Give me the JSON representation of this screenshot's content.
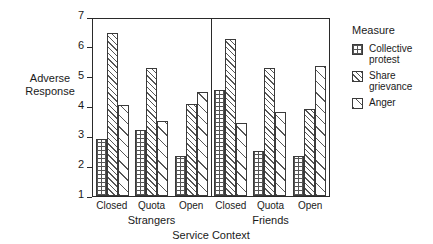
{
  "chart_data": {
    "type": "bar",
    "title": "",
    "xlabel": "Service Context",
    "ylabel": "Adverse Response",
    "ylim": [
      1,
      7
    ],
    "yticks": [
      1,
      2,
      3,
      4,
      5,
      6,
      7
    ],
    "grid": false,
    "legend_position": "right",
    "legend_title": "Measure",
    "sections": [
      "Strangers",
      "Friends"
    ],
    "categories": [
      "Closed",
      "Quota",
      "Open",
      "Closed",
      "Quota",
      "Open"
    ],
    "groups": [
      {
        "section": "Strangers",
        "category": "Closed"
      },
      {
        "section": "Strangers",
        "category": "Quota"
      },
      {
        "section": "Strangers",
        "category": "Open"
      },
      {
        "section": "Friends",
        "category": "Closed"
      },
      {
        "section": "Friends",
        "category": "Quota"
      },
      {
        "section": "Friends",
        "category": "Open"
      }
    ],
    "series": [
      {
        "name": "Collective protest",
        "pattern": "crosshatch-grid",
        "values": [
          2.9,
          3.2,
          2.35,
          4.55,
          2.5,
          2.35
        ]
      },
      {
        "name": "Share grievance",
        "pattern": "dense-diagonal-hatch",
        "values": [
          6.45,
          5.3,
          4.1,
          6.25,
          5.3,
          3.9
        ]
      },
      {
        "name": "Anger",
        "pattern": "sparse-diagonal-hatch",
        "values": [
          4.05,
          3.5,
          4.5,
          3.45,
          3.8,
          5.35
        ]
      }
    ]
  },
  "axis": {
    "y_title": "Adverse Response",
    "y_title_line1": "Adverse",
    "y_title_line2": "Response",
    "x_title": "Service Context",
    "tick_labels": [
      "1",
      "2",
      "3",
      "4",
      "5",
      "6",
      "7"
    ]
  },
  "legend": {
    "title": "Measure",
    "items": [
      {
        "label": "Collective protest",
        "line1": "Collective",
        "line2": "protest",
        "swatch": "crosshatch-grid-swatch"
      },
      {
        "label": "Share grievance",
        "line1": "Share",
        "line2": "grievance",
        "swatch": "dense-hatch-swatch"
      },
      {
        "label": "Anger",
        "line1": "Anger",
        "line2": "",
        "swatch": "sparse-hatch-swatch"
      }
    ]
  },
  "colors": {
    "axis": "#2a2a2a",
    "hatch": "#555555",
    "background": "#ffffff",
    "text": "#1a1a1a"
  }
}
